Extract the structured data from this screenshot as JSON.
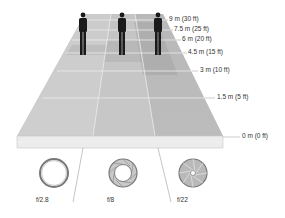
{
  "diagram": {
    "topic": "Depth of field vs. aperture",
    "distance_markers": [
      {
        "label": "9 m (30 ft)",
        "y": 20
      },
      {
        "label": "7.5 m (25 ft)",
        "y": 30
      },
      {
        "label": "6 m (20 ft)",
        "y": 40
      },
      {
        "label": "4.5 m (15 ft)",
        "y": 53
      },
      {
        "label": "3 m (10 ft)",
        "y": 71
      },
      {
        "label": "1.5 m (5 ft)",
        "y": 98
      },
      {
        "label": "0 m (0 ft)",
        "y": 137
      }
    ],
    "apertures": [
      {
        "label": "f/2.8",
        "blades": "wide-open"
      },
      {
        "label": "f/8",
        "blades": "medium"
      },
      {
        "label": "f/22",
        "blades": "stopped-down"
      }
    ],
    "figures": [
      {
        "name": "person-left"
      },
      {
        "name": "person-center"
      },
      {
        "name": "person-right"
      }
    ],
    "colors": {
      "plane_light": "#d4d4d4",
      "plane_mid": "#bcbcbc",
      "plane_dark": "#a8a8a8",
      "slab_front": "#ececec",
      "figure": "#1a1a1a",
      "text": "#333333"
    }
  }
}
